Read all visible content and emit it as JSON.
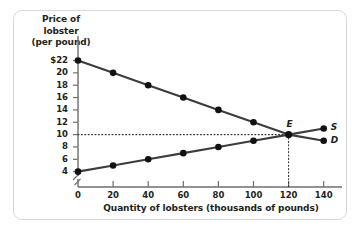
{
  "chart_data": {
    "type": "line",
    "title": "",
    "ylabel_lines": [
      "Price of",
      "lobster",
      "(per pound)"
    ],
    "xlabel": "Quantity of lobsters (thousands of pounds)",
    "x_ticks": [
      0,
      20,
      40,
      60,
      80,
      100,
      120,
      140
    ],
    "x_tick_labels": [
      "0",
      "20",
      "40",
      "60",
      "80",
      "100",
      "120",
      "140"
    ],
    "y_ticks": [
      4,
      6,
      8,
      10,
      12,
      14,
      16,
      18,
      20,
      22
    ],
    "y_tick_labels": [
      "4",
      "6",
      "8",
      "10",
      "12",
      "14",
      "16",
      "18",
      "20",
      "$22"
    ],
    "xlim": [
      0,
      150
    ],
    "ylim": [
      3,
      23
    ],
    "grid": false,
    "axis_break_y": true,
    "legend_position": "inline-right",
    "series": [
      {
        "name": "D",
        "label": "D",
        "x": [
          0,
          20,
          40,
          60,
          80,
          100,
          120,
          140
        ],
        "values": [
          22,
          20,
          18,
          16,
          14,
          12,
          10,
          9
        ]
      },
      {
        "name": "S",
        "label": "S",
        "x": [
          0,
          20,
          40,
          60,
          80,
          100,
          120,
          140
        ],
        "values": [
          4,
          5,
          6,
          7,
          8,
          9,
          10,
          11
        ]
      }
    ],
    "annotations": [
      {
        "name": "equilibrium",
        "label": "E",
        "x": 120,
        "y": 10,
        "guides": [
          "horizontal-to-y-axis",
          "vertical-to-x-axis"
        ]
      }
    ],
    "colors": {
      "curve": "#3c3c3c",
      "marker": "#111111",
      "axis": "#6e6e6e",
      "text": "#231f20",
      "frame": "#d8d8d8",
      "background": "#ffffff"
    }
  }
}
